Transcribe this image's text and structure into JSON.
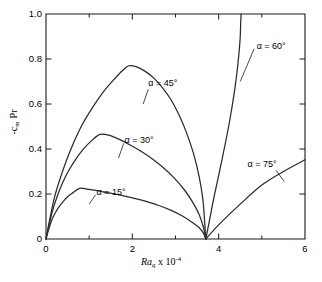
{
  "chart_data": {
    "type": "line",
    "title": "",
    "xlabel": "Ra_q x 10^-4",
    "ylabel": "-c_m Pr",
    "xlim": [
      0,
      6
    ],
    "ylim": [
      0,
      1.0
    ],
    "grid": false,
    "legend_position": "inline-annotations",
    "x_ticks_major": [
      0,
      2,
      4,
      6
    ],
    "x_ticks_minor": [
      1,
      3,
      5
    ],
    "y_ticks_major": [
      0,
      0.2,
      0.4,
      0.6,
      0.8,
      1.0
    ],
    "x_tick_labels": [
      "0",
      "2",
      "4",
      "6"
    ],
    "y_tick_labels": [
      "0",
      "0.2",
      "0.4",
      "0.6",
      "0.8",
      "1.0"
    ],
    "convergence_point": [
      3.7,
      0
    ],
    "series": [
      {
        "name": "alpha = 15 deg",
        "label": "α = 15°",
        "peak": [
          0.78,
          0.225
        ],
        "points": [
          [
            0.0,
            0.0
          ],
          [
            0.05,
            0.035
          ],
          [
            0.1,
            0.065
          ],
          [
            0.15,
            0.092
          ],
          [
            0.22,
            0.118
          ],
          [
            0.3,
            0.143
          ],
          [
            0.4,
            0.167
          ],
          [
            0.5,
            0.188
          ],
          [
            0.62,
            0.205
          ],
          [
            0.78,
            0.225
          ],
          [
            0.95,
            0.222
          ],
          [
            1.15,
            0.216
          ],
          [
            1.4,
            0.207
          ],
          [
            1.7,
            0.196
          ],
          [
            2.0,
            0.183
          ],
          [
            2.3,
            0.168
          ],
          [
            2.6,
            0.15
          ],
          [
            2.9,
            0.127
          ],
          [
            3.15,
            0.103
          ],
          [
            3.4,
            0.072
          ],
          [
            3.55,
            0.05
          ],
          [
            3.65,
            0.025
          ],
          [
            3.7,
            0.0
          ]
        ]
      },
      {
        "name": "alpha = 30 deg",
        "label": "α = 30°",
        "peak": [
          1.25,
          0.465
        ],
        "points": [
          [
            0.0,
            0.0
          ],
          [
            0.08,
            0.07
          ],
          [
            0.16,
            0.131
          ],
          [
            0.26,
            0.19
          ],
          [
            0.38,
            0.248
          ],
          [
            0.52,
            0.302
          ],
          [
            0.68,
            0.352
          ],
          [
            0.86,
            0.398
          ],
          [
            1.05,
            0.436
          ],
          [
            1.25,
            0.465
          ],
          [
            1.45,
            0.462
          ],
          [
            1.7,
            0.443
          ],
          [
            1.95,
            0.418
          ],
          [
            2.2,
            0.39
          ],
          [
            2.45,
            0.358
          ],
          [
            2.7,
            0.32
          ],
          [
            2.95,
            0.275
          ],
          [
            3.2,
            0.22
          ],
          [
            3.4,
            0.163
          ],
          [
            3.55,
            0.108
          ],
          [
            3.65,
            0.05
          ],
          [
            3.7,
            0.0
          ]
        ]
      },
      {
        "name": "alpha = 45 deg",
        "label": "α = 45°",
        "peak": [
          1.92,
          0.77
        ],
        "points": [
          [
            0.0,
            0.0
          ],
          [
            0.1,
            0.1
          ],
          [
            0.2,
            0.188
          ],
          [
            0.33,
            0.27
          ],
          [
            0.48,
            0.352
          ],
          [
            0.65,
            0.432
          ],
          [
            0.85,
            0.512
          ],
          [
            1.08,
            0.585
          ],
          [
            1.32,
            0.652
          ],
          [
            1.58,
            0.71
          ],
          [
            1.78,
            0.75
          ],
          [
            1.92,
            0.77
          ],
          [
            2.1,
            0.765
          ],
          [
            2.3,
            0.745
          ],
          [
            2.5,
            0.715
          ],
          [
            2.7,
            0.672
          ],
          [
            2.9,
            0.618
          ],
          [
            3.08,
            0.552
          ],
          [
            3.25,
            0.475
          ],
          [
            3.42,
            0.378
          ],
          [
            3.55,
            0.275
          ],
          [
            3.64,
            0.165
          ],
          [
            3.7,
            0.0
          ]
        ]
      },
      {
        "name": "alpha = 60 deg",
        "label": "α = 60°",
        "points": [
          [
            3.7,
            0.0
          ],
          [
            3.79,
            0.085
          ],
          [
            3.88,
            0.175
          ],
          [
            3.98,
            0.265
          ],
          [
            4.08,
            0.355
          ],
          [
            4.17,
            0.44
          ],
          [
            4.25,
            0.52
          ],
          [
            4.32,
            0.6
          ],
          [
            4.38,
            0.675
          ],
          [
            4.43,
            0.75
          ],
          [
            4.47,
            0.825
          ],
          [
            4.5,
            0.9
          ],
          [
            4.51,
            0.96
          ],
          [
            4.52,
            1.0
          ]
        ]
      },
      {
        "name": "alpha = 75 deg",
        "label": "α = 75°",
        "points": [
          [
            3.7,
            0.0
          ],
          [
            4.0,
            0.063
          ],
          [
            4.5,
            0.155
          ],
          [
            5.0,
            0.24
          ],
          [
            5.5,
            0.3
          ],
          [
            6.0,
            0.352
          ]
        ]
      }
    ],
    "annotations": [
      {
        "text": "α = 45°",
        "x": 2.37,
        "y": 0.69
      },
      {
        "text": "α = 60°",
        "x": 4.88,
        "y": 0.855
      },
      {
        "text": "α = 30°",
        "x": 1.82,
        "y": 0.435
      },
      {
        "text": "α = 15°",
        "x": 1.17,
        "y": 0.205
      },
      {
        "text": "α = 75°",
        "x": 4.67,
        "y": 0.33
      }
    ]
  },
  "axis": {
    "x_title_main": "Ra",
    "x_title_sub": "q",
    "x_title_mult": " x 10",
    "x_title_exp": "-4",
    "y_title_prefix": "-",
    "y_title_c": "c",
    "y_title_csub": "m",
    "y_title_pr": "Pr",
    "x_labels": [
      "0",
      "2",
      "4",
      "6"
    ],
    "y_labels": [
      "0",
      "0.2",
      "0.4",
      "0.6",
      "0.8",
      "1.0"
    ]
  },
  "labels": {
    "a15": "α = 15°",
    "a30": "α = 30°",
    "a45": "α = 45°",
    "a60": "α = 60°",
    "a75": "α = 75°"
  },
  "colors": {
    "curve": "#2b2b2b",
    "axis": "#1a1a1a",
    "background": "#ffffff"
  }
}
